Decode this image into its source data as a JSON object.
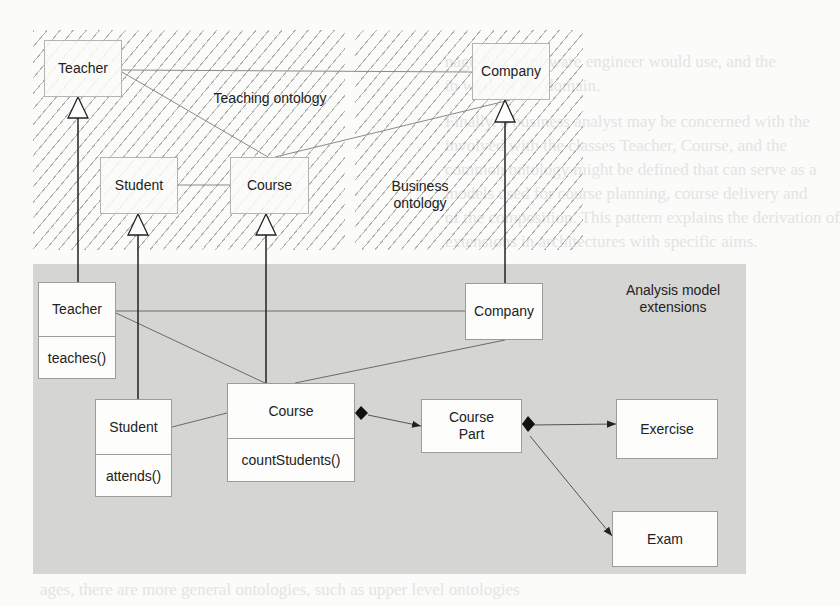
{
  "regions": {
    "teaching": {
      "label": "Teaching ontology"
    },
    "business": {
      "label": "Business ontology",
      "label_line1": "Business",
      "label_line2": "ontology"
    },
    "analysis": {
      "label_line1": "Analysis model",
      "label_line2": "extensions"
    }
  },
  "ontology_classes": {
    "teacher": {
      "name": "Teacher"
    },
    "company": {
      "name": "Company"
    },
    "student": {
      "name": "Student"
    },
    "course": {
      "name": "Course"
    }
  },
  "analysis_classes": {
    "teacher": {
      "name": "Teacher",
      "operation": "teaches()"
    },
    "company": {
      "name": "Company"
    },
    "student": {
      "name": "Student",
      "operation": "attends()"
    },
    "course": {
      "name": "Course",
      "operation": "countStudents()"
    },
    "course_part": {
      "name_line1": "Course",
      "name_line2": "Part"
    },
    "exercise": {
      "name": "Exercise"
    },
    "exam": {
      "name": "Exam"
    }
  },
  "relationships": [
    {
      "from": "Teacher (analysis)",
      "to": "Teacher (ontology)",
      "type": "generalization"
    },
    {
      "from": "Student (analysis)",
      "to": "Student (ontology)",
      "type": "generalization"
    },
    {
      "from": "Course (analysis)",
      "to": "Course (ontology)",
      "type": "generalization"
    },
    {
      "from": "Company (analysis)",
      "to": "Company (ontology)",
      "type": "generalization"
    },
    {
      "from": "Course",
      "to": "Course Part",
      "type": "composition"
    },
    {
      "from": "Course Part",
      "to": "Exercise",
      "type": "composition"
    },
    {
      "from": "Course Part",
      "to": "Exam",
      "type": "composition"
    }
  ],
  "background_text": [
    "nage that a software engineer would use, and the",
    "in work of the domain.",
    "Finally, a business analyst may be concerned with the",
    "involved with the classes Teacher, Course, and the",
    "common ontology might be defined that can serve as a",
    "models used for course planning, course delivery and",
    "of the composition. This pattern explains the derivation of",
    "extensions in architectures with specific aims.",
    "Further, the software models usually are tailored for each",
    "domain models are expressed with the analysis model",
    "extend the information and enhance its completeness.",
    "In the case of the teaching ontology, classes may be",
    "a lot with which the models might be defined in the",
    "be defined using the analysis classes in the figure",
    "models used.",
    "ontologies can deal with different abstraction levels",
    "ages, there are more general ontologies, such as upper level ontologies"
  ]
}
